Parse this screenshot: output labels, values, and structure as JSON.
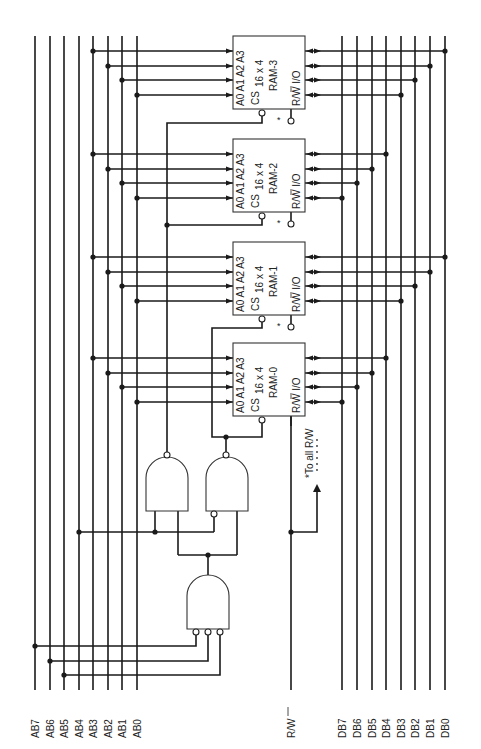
{
  "address_bus": {
    "labels": [
      "AB7",
      "AB6",
      "AB5",
      "AB4",
      "AB3",
      "AB2",
      "AB1",
      "AB0"
    ],
    "x": [
      35,
      50,
      64,
      79,
      93,
      108,
      122,
      137
    ]
  },
  "data_bus": {
    "labels": [
      "DB7",
      "DB6",
      "DB5",
      "DB4",
      "DB3",
      "DB2",
      "DB1",
      "DB0"
    ],
    "x": [
      342,
      357,
      372,
      386,
      401,
      415,
      430,
      445
    ]
  },
  "control": {
    "rw_label": "R/W",
    "rw_note": "*To all R/W"
  },
  "rams": [
    {
      "name": "RAM-3",
      "size": "16 x 4",
      "y": 36
    },
    {
      "name": "RAM-2",
      "size": "16 x 4",
      "y": 139
    },
    {
      "name": "RAM-1",
      "size": "16 x 4",
      "y": 242
    },
    {
      "name": "RAM-0",
      "size": "16 x 4",
      "y": 343
    }
  ],
  "pins": {
    "a0": "A0",
    "a1": "A1",
    "a2": "A2",
    "a3": "A3",
    "cs": "CS",
    "rw": "R/W",
    "io": "I/O",
    "star": "*"
  },
  "gates": [
    {
      "name": "nand-ram1-select",
      "type": "NAND",
      "inputs": 2
    },
    {
      "name": "nand-ram0-select",
      "type": "NAND",
      "inputs": 2,
      "inverted_input": true
    },
    {
      "name": "and-enable",
      "type": "AND",
      "inputs": 3,
      "inverted_inputs": 3
    }
  ]
}
